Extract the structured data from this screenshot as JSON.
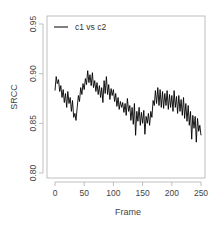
{
  "chart_data": {
    "type": "line",
    "title": "",
    "xlabel": "Frame",
    "ylabel": "SRCC",
    "xlim": [
      0,
      250
    ],
    "ylim": [
      0.8,
      0.95
    ],
    "xticks": [
      0,
      50,
      100,
      150,
      200,
      250
    ],
    "xtick_labels": [
      "0",
      "50",
      "100",
      "150",
      "200",
      "250"
    ],
    "yticks": [
      0.8,
      0.85,
      0.9,
      0.95
    ],
    "ytick_labels": [
      "0.80",
      "0.85",
      "0.90",
      "0.95"
    ],
    "grid": false,
    "legend_position": "top-left",
    "series": [
      {
        "name": "c1 vs c2",
        "color": "#000000",
        "x_step": 2,
        "x_start": 0,
        "values": [
          0.883,
          0.897,
          0.89,
          0.894,
          0.882,
          0.888,
          0.876,
          0.884,
          0.871,
          0.88,
          0.866,
          0.882,
          0.87,
          0.876,
          0.862,
          0.873,
          0.856,
          0.86,
          0.853,
          0.866,
          0.878,
          0.872,
          0.886,
          0.879,
          0.89,
          0.884,
          0.895,
          0.889,
          0.903,
          0.891,
          0.899,
          0.888,
          0.901,
          0.886,
          0.893,
          0.882,
          0.891,
          0.879,
          0.888,
          0.876,
          0.886,
          0.871,
          0.893,
          0.88,
          0.897,
          0.879,
          0.889,
          0.874,
          0.885,
          0.878,
          0.884,
          0.872,
          0.88,
          0.867,
          0.876,
          0.864,
          0.872,
          0.866,
          0.871,
          0.861,
          0.87,
          0.858,
          0.875,
          0.862,
          0.868,
          0.853,
          0.866,
          0.849,
          0.87,
          0.838,
          0.862,
          0.852,
          0.866,
          0.848,
          0.861,
          0.85,
          0.863,
          0.839,
          0.857,
          0.85,
          0.86,
          0.848,
          0.862,
          0.856,
          0.873,
          0.868,
          0.883,
          0.87,
          0.886,
          0.868,
          0.884,
          0.866,
          0.882,
          0.865,
          0.88,
          0.868,
          0.883,
          0.864,
          0.879,
          0.866,
          0.878,
          0.862,
          0.883,
          0.866,
          0.877,
          0.86,
          0.878,
          0.862,
          0.874,
          0.858,
          0.876,
          0.855,
          0.87,
          0.852,
          0.868,
          0.848,
          0.862,
          0.834,
          0.858,
          0.845,
          0.857,
          0.831,
          0.855,
          0.842,
          0.848,
          0.838
        ]
      }
    ]
  },
  "legend": {
    "entries": [
      {
        "label": "c1 vs c2",
        "color": "#000000"
      }
    ]
  },
  "axes": {
    "x_title": "Frame",
    "y_title": "SRCC"
  }
}
